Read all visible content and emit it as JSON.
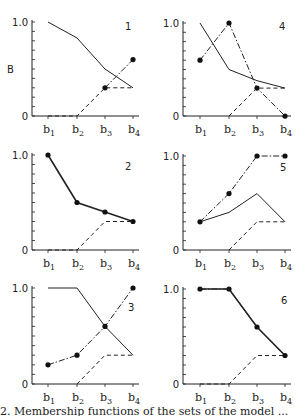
{
  "chart_data": [
    {
      "panel": "1",
      "type": "line",
      "ylabel": "B",
      "categories": [
        "b1",
        "b2",
        "b3",
        "b4"
      ],
      "ylim": [
        0,
        1.0
      ],
      "series": [
        {
          "name": "solid",
          "style": "solid",
          "markers": false,
          "x": [
            1,
            2,
            3,
            4
          ],
          "values": [
            1.0,
            0.83,
            0.5,
            0.3
          ]
        },
        {
          "name": "dash-dot",
          "style": "dashdot",
          "markers": true,
          "x": [
            3,
            4
          ],
          "values": [
            0.3,
            0.6
          ]
        },
        {
          "name": "dashed",
          "style": "dashed",
          "markers": false,
          "x": [
            1,
            2,
            3,
            4
          ],
          "values": [
            0,
            0,
            0.3,
            0.3
          ]
        }
      ]
    },
    {
      "panel": "4",
      "type": "line",
      "ylabel": "",
      "categories": [
        "b1",
        "b2",
        "b3",
        "b4"
      ],
      "ylim": [
        0,
        1.0
      ],
      "series": [
        {
          "name": "solid",
          "style": "solid",
          "markers": false,
          "x": [
            1,
            2,
            3,
            4
          ],
          "values": [
            1.0,
            0.5,
            0.38,
            0.3
          ]
        },
        {
          "name": "dash-dot",
          "style": "dashdot",
          "markers": true,
          "x": [
            1,
            2,
            3,
            4
          ],
          "values": [
            0.6,
            1.0,
            0.3,
            0
          ]
        },
        {
          "name": "dashed",
          "style": "dashed",
          "markers": false,
          "x": [
            2,
            3,
            4
          ],
          "values": [
            0,
            0.3,
            0.3
          ]
        }
      ]
    },
    {
      "panel": "2",
      "type": "line",
      "ylabel": "",
      "categories": [
        "b1",
        "b2",
        "b3",
        "b4"
      ],
      "ylim": [
        0,
        1.0
      ],
      "series": [
        {
          "name": "solid",
          "style": "solid",
          "markers": true,
          "x": [
            1,
            2,
            3,
            4
          ],
          "values": [
            1.0,
            0.5,
            0.4,
            0.3
          ]
        },
        {
          "name": "dashed",
          "style": "dashed",
          "markers": false,
          "x": [
            1,
            2,
            3,
            4
          ],
          "values": [
            0,
            0,
            0.3,
            0.3
          ]
        }
      ]
    },
    {
      "panel": "5",
      "type": "line",
      "ylabel": "",
      "categories": [
        "b1",
        "b2",
        "b3",
        "b4"
      ],
      "ylim": [
        0,
        1.0
      ],
      "series": [
        {
          "name": "solid",
          "style": "solid",
          "markers": false,
          "x": [
            1,
            2,
            3,
            4
          ],
          "values": [
            0.3,
            0.4,
            0.6,
            0.3
          ]
        },
        {
          "name": "dash-dot",
          "style": "dashdot",
          "markers": true,
          "x": [
            1,
            2,
            3,
            4
          ],
          "values": [
            0.3,
            0.6,
            1.0,
            1.0
          ]
        },
        {
          "name": "dashed",
          "style": "dashed",
          "markers": false,
          "x": [
            2,
            3,
            4
          ],
          "values": [
            0,
            0.3,
            0.3
          ]
        }
      ]
    },
    {
      "panel": "3",
      "type": "line",
      "ylabel": "",
      "categories": [
        "b1",
        "b2",
        "b3",
        "b4"
      ],
      "ylim": [
        0,
        1.0
      ],
      "series": [
        {
          "name": "solid",
          "style": "solid",
          "markers": false,
          "x": [
            1,
            2,
            3,
            4
          ],
          "values": [
            1.0,
            1.0,
            0.6,
            0.3
          ]
        },
        {
          "name": "dash-dot",
          "style": "dashdot",
          "markers": true,
          "x": [
            1,
            2,
            3,
            4
          ],
          "values": [
            0.2,
            0.3,
            0.6,
            1.0
          ]
        },
        {
          "name": "dashed",
          "style": "dashed",
          "markers": false,
          "x": [
            2,
            3,
            4
          ],
          "values": [
            0,
            0.3,
            0.3
          ]
        }
      ]
    },
    {
      "panel": "6",
      "type": "line",
      "ylabel": "",
      "categories": [
        "b1",
        "b2",
        "b3",
        "b4"
      ],
      "ylim": [
        0,
        1.0
      ],
      "series": [
        {
          "name": "solid",
          "style": "solid",
          "markers": true,
          "x": [
            1,
            2,
            3,
            4
          ],
          "values": [
            1.0,
            1.0,
            0.6,
            0.3
          ]
        },
        {
          "name": "dash-dot",
          "style": "dashdot",
          "markers": false,
          "x": [
            1,
            2,
            3,
            4
          ],
          "values": [
            1.0,
            1.0,
            0.6,
            0.3
          ]
        },
        {
          "name": "dashed",
          "style": "dashed",
          "markers": false,
          "x": [
            1,
            2,
            3,
            4
          ],
          "values": [
            0,
            0,
            0.3,
            0.3
          ]
        }
      ]
    }
  ],
  "layout": {
    "panels": [
      {
        "axisX": 32,
        "top": 22,
        "zero": 116,
        "bx": [
          48,
          77,
          105,
          133
        ],
        "labelX": 125,
        "labelY": 30
      },
      {
        "axisX": 183,
        "top": 23,
        "zero": 116,
        "bx": [
          200,
          229,
          257,
          285
        ],
        "labelX": 279,
        "labelY": 30
      },
      {
        "axisX": 32,
        "top": 155,
        "zero": 250,
        "bx": [
          48,
          77,
          105,
          133
        ],
        "labelX": 125,
        "labelY": 170
      },
      {
        "axisX": 183,
        "top": 156,
        "zero": 250,
        "bx": [
          200,
          229,
          257,
          285
        ],
        "labelX": 280,
        "labelY": 171
      },
      {
        "axisX": 32,
        "top": 288,
        "zero": 384,
        "bx": [
          48,
          77,
          105,
          133
        ],
        "labelX": 128,
        "labelY": 311
      },
      {
        "axisX": 183,
        "top": 289,
        "zero": 384,
        "bx": [
          200,
          229,
          257,
          285
        ],
        "labelX": 281,
        "labelY": 304
      }
    ]
  },
  "tick_labels": {
    "top": "1.0",
    "bottom": "0"
  },
  "caption": "2. Membership functions of the sets of the model ..."
}
